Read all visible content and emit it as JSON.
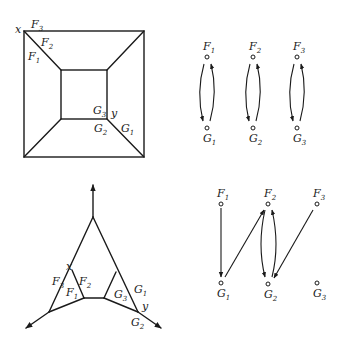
{
  "panels": {
    "square_graph": {
      "labels": {
        "x": "x",
        "y": "y",
        "F1": "F",
        "F1_sub": "1",
        "F2": "F",
        "F2_sub": "2",
        "F3": "F",
        "F3_sub": "3",
        "G1": "G",
        "G1_sub": "1",
        "G2": "G",
        "G2_sub": "2",
        "G3": "G",
        "G3_sub": "3"
      }
    },
    "bipartite_top": {
      "nodes_top": [
        {
          "name": "F",
          "sub": "1"
        },
        {
          "name": "F",
          "sub": "2"
        },
        {
          "name": "F",
          "sub": "3"
        }
      ],
      "nodes_bottom": [
        {
          "name": "G",
          "sub": "1"
        },
        {
          "name": "G",
          "sub": "2"
        },
        {
          "name": "G",
          "sub": "3"
        }
      ],
      "edges": [
        {
          "from": "F1",
          "to": "G1"
        },
        {
          "from": "G1",
          "to": "F1"
        },
        {
          "from": "F2",
          "to": "G2"
        },
        {
          "from": "G2",
          "to": "F2"
        },
        {
          "from": "F3",
          "to": "G3"
        },
        {
          "from": "G3",
          "to": "F3"
        }
      ]
    },
    "triangle_graph": {
      "labels": {
        "x": "x",
        "y": "y",
        "F1": "F",
        "F1_sub": "1",
        "F2": "F",
        "F2_sub": "2",
        "F3": "F",
        "F3_sub": "3",
        "G1": "G",
        "G1_sub": "1",
        "G2": "G",
        "G2_sub": "2",
        "G3": "G",
        "G3_sub": "3"
      }
    },
    "bipartite_bottom": {
      "nodes_top": [
        {
          "name": "F",
          "sub": "1"
        },
        {
          "name": "F",
          "sub": "2"
        },
        {
          "name": "F",
          "sub": "3"
        }
      ],
      "nodes_bottom": [
        {
          "name": "G",
          "sub": "1"
        },
        {
          "name": "G",
          "sub": "2"
        },
        {
          "name": "G",
          "sub": "3"
        }
      ],
      "edges": [
        {
          "from": "F1",
          "to": "G1"
        },
        {
          "from": "G1",
          "to": "F2"
        },
        {
          "from": "F2",
          "to": "G2"
        },
        {
          "from": "G2",
          "to": "F2"
        },
        {
          "from": "F3",
          "to": "G2"
        }
      ]
    }
  }
}
